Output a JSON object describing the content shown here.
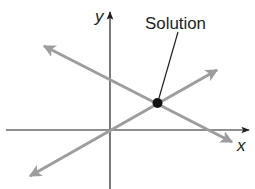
{
  "diagram": {
    "type": "system-of-linear-equations-graph",
    "axes": {
      "x_label": "x",
      "y_label": "y"
    },
    "annotation": {
      "label": "Solution"
    },
    "lines": [
      {
        "name": "decreasing-line",
        "direction": "negative slope",
        "color": "#9d9d9d"
      },
      {
        "name": "increasing-line",
        "direction": "positive slope, through origin",
        "color": "#9d9d9d"
      }
    ],
    "intersection_point": {
      "description": "intersection of the two lines, first quadrant",
      "color": "#111111"
    },
    "colors": {
      "axis": "#231f20",
      "line": "#9d9d9d",
      "point": "#111111",
      "text": "#231f20"
    }
  }
}
